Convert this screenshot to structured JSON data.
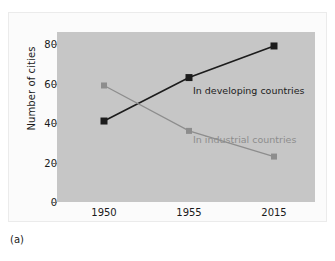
{
  "caption": "(a)",
  "chart_data": {
    "type": "line",
    "title": "",
    "xlabel": "",
    "ylabel": "Number of cities",
    "categories": [
      "1950",
      "1955",
      "2015"
    ],
    "x_tick_labels": [
      "1950",
      "1955",
      "2015"
    ],
    "y_tick_labels": [
      "0",
      "20",
      "40",
      "60",
      "80"
    ],
    "y_ticks": [
      0,
      20,
      40,
      60,
      80
    ],
    "ylim": [
      0,
      86
    ],
    "grid": false,
    "legend_position": "inline-annotation",
    "series": [
      {
        "name": "In developing countries",
        "label": "In developing countries",
        "color": "#1c1c1c",
        "marker": "square",
        "values": [
          41,
          63,
          79
        ]
      },
      {
        "name": "In industrial countries",
        "label": "In industrial countries",
        "color": "#8d8d8d",
        "marker": "square",
        "values": [
          59,
          36,
          23
        ]
      }
    ],
    "annotations": [
      {
        "text": "In developing countries",
        "color": "#1c1c1c"
      },
      {
        "text": "In industrial countries",
        "color": "#8d8d8d"
      }
    ],
    "plot_background_color": "#c6c6c6",
    "figure_background_color": "#fbfbfb"
  }
}
